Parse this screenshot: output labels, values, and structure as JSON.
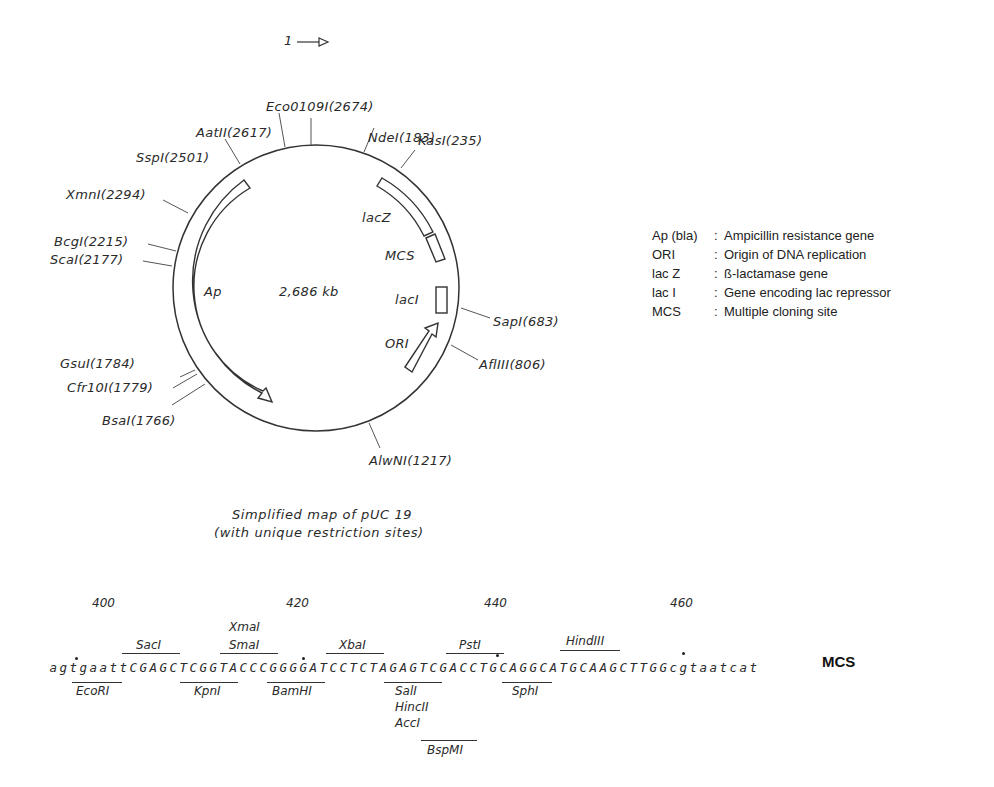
{
  "origin_marker": {
    "label": "1"
  },
  "plasmid": {
    "name": "pUC 19",
    "size_label": "2,686 kb",
    "circle": {
      "cx": 316,
      "cy": 288,
      "r": 143
    },
    "genes": [
      {
        "label": "Ap",
        "type": "arrow"
      },
      {
        "label": "lacZ",
        "type": "box"
      },
      {
        "label": "MCS",
        "type": "box"
      },
      {
        "label": "lacI",
        "type": "box"
      },
      {
        "label": "ORI",
        "type": "arrow"
      }
    ],
    "restriction_sites": [
      {
        "label": "Eco0109I(2674)"
      },
      {
        "label": "AatII(2617)"
      },
      {
        "label": "SspI(2501)"
      },
      {
        "label": "NdeI(183)"
      },
      {
        "label": "KasI(235)"
      },
      {
        "label": "XmnI(2294)"
      },
      {
        "label": "BcgI(2215)"
      },
      {
        "label": "ScaI(2177)"
      },
      {
        "label": "SapI(683)"
      },
      {
        "label": "AflIII(806)"
      },
      {
        "label": "GsuI(1784)"
      },
      {
        "label": "Cfr10I(1779)"
      },
      {
        "label": "BsaI(1766)"
      },
      {
        "label": "AlwNI(1217)"
      }
    ]
  },
  "legend": [
    {
      "key": "Ap (bla)",
      "sep": ":",
      "desc": "Ampicillin resistance gene"
    },
    {
      "key": "ORI",
      "sep": ":",
      "desc": "Origin of DNA replication"
    },
    {
      "key": "lac Z",
      "sep": ":",
      "desc": "ß-lactamase gene"
    },
    {
      "key": "lac I",
      "sep": ":",
      "desc": "Gene encoding lac repressor"
    },
    {
      "key": "MCS",
      "sep": ":",
      "desc": "Multiple cloning site"
    }
  ],
  "caption": {
    "line1": "Simplified map of pUC 19",
    "line2": "(with unique restriction sites)"
  },
  "mcs": {
    "title": "MCS",
    "sequence": "agtgaattCGAGCTCGGTACCCGGGGATCCTCTAGAGTCGACCTGCAGGCATGCAAGCTTGGcgtaatcat",
    "positions": [
      {
        "label": "400"
      },
      {
        "label": "420"
      },
      {
        "label": "440"
      },
      {
        "label": "460"
      }
    ],
    "enzymes_above": [
      {
        "label": "SacI"
      },
      {
        "label": "XmaI"
      },
      {
        "label": "SmaI"
      },
      {
        "label": "XbaI"
      },
      {
        "label": "PstI"
      },
      {
        "label": "HindIII"
      }
    ],
    "enzymes_below": [
      {
        "label": "EcoRI"
      },
      {
        "label": "KpnI"
      },
      {
        "label": "BamHI"
      },
      {
        "label": "SalI"
      },
      {
        "label": "HincII"
      },
      {
        "label": "AccI"
      },
      {
        "label": "SphI"
      },
      {
        "label": "BspMI"
      }
    ]
  }
}
